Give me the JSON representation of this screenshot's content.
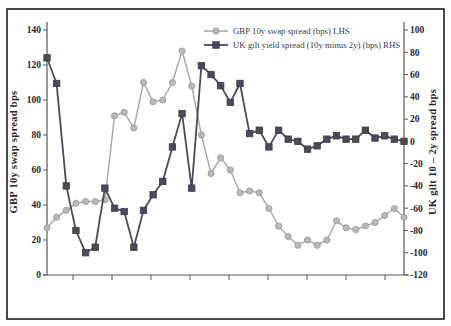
{
  "figure": {
    "legend": [
      {
        "label": "GBP 10y swap spread (bps) LHS"
      },
      {
        "label": "UK gilt yield spread (10y minus 2y) (bps) RHS"
      }
    ]
  },
  "chart_data": {
    "type": "line",
    "title": "",
    "n_points": 38,
    "x_labels_visible": false,
    "x_minor_tick_count": 9,
    "grid": false,
    "legend_position": "top-center",
    "left_axis": {
      "label": "GBP 10y swap spread bps",
      "min": 0,
      "max": 140,
      "tick_step": 20,
      "ticks": [
        0,
        20,
        40,
        60,
        80,
        100,
        120,
        140
      ]
    },
    "right_axis": {
      "label": "UK gilt 10 – 2y spread bps",
      "min": -120,
      "max": 100,
      "tick_step": 20,
      "ticks": [
        100,
        80,
        60,
        40,
        20,
        0,
        -20,
        -40,
        -60,
        -80,
        -100,
        -120
      ]
    },
    "series": [
      {
        "name": "GBP 10y swap spread (bps) LHS",
        "axis": "left",
        "marker": "circle",
        "color": "#ababab",
        "marker_fill": "#b9b9b9",
        "marker_stroke": "#979797",
        "values": [
          27,
          33,
          37,
          41,
          42,
          42,
          43,
          91,
          93,
          84,
          110,
          99,
          100,
          110,
          128,
          108,
          80,
          58,
          67,
          60,
          47,
          48,
          47,
          38,
          28,
          22,
          17,
          20,
          17,
          20,
          31,
          27,
          26,
          28,
          30,
          34,
          38,
          33
        ]
      },
      {
        "name": "UK gilt yield spread (10y minus 2y) (bps) RHS",
        "axis": "right",
        "marker": "square",
        "color": "#4a4a58",
        "marker_fill": "#4a4a58",
        "marker_stroke": "#3c3c4a",
        "values": [
          75,
          52,
          -40,
          -80,
          -100,
          -95,
          -42,
          -60,
          -63,
          -95,
          -62,
          -48,
          -36,
          -5,
          25,
          -42,
          68,
          60,
          50,
          35,
          52,
          7,
          10,
          -5,
          10,
          2,
          0,
          -7,
          -4,
          2,
          5,
          2,
          2,
          10,
          3,
          5,
          2,
          0
        ]
      }
    ],
    "colors": {
      "frame": "#1c1c1c",
      "axis": "#56565e",
      "text": "#26262e"
    }
  }
}
